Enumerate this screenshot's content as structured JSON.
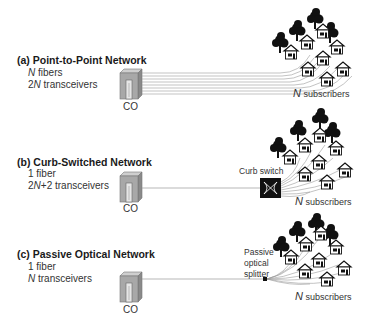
{
  "panels": [
    {
      "id": "a",
      "title": "(a) Point-to-Point Network",
      "line1_n": "N",
      "line1_rest": " fibers",
      "line2_prefix": "2",
      "line2_n": "N",
      "line2_rest": " transceivers",
      "co_label": "CO",
      "subscribers_n": "N",
      "subscribers_text": " subscribers",
      "device_label": ""
    },
    {
      "id": "b",
      "title": "(b) Curb-Switched Network",
      "line1_n": "",
      "line1_rest": "1 fiber",
      "line2_prefix": "2",
      "line2_n": "N",
      "line2_rest": "+2 transceivers",
      "co_label": "CO",
      "subscribers_n": "N",
      "subscribers_text": " subscribers",
      "device_label": "Curb switch"
    },
    {
      "id": "c",
      "title": "(c) Passive Optical Network",
      "line1_n": "",
      "line1_rest": "1 fiber",
      "line2_prefix": "",
      "line2_n": "N",
      "line2_rest": " transceivers",
      "co_label": "CO",
      "subscribers_n": "N",
      "subscribers_text": " subscribers",
      "device_label_lines": [
        "Passive",
        "optical",
        "splitter"
      ]
    }
  ],
  "colors": {
    "building": "#a8a8a8",
    "building_dark": "#7a7a7a",
    "fiber": "#9a9a9a",
    "tree": "#111111",
    "switch": "#111111"
  }
}
